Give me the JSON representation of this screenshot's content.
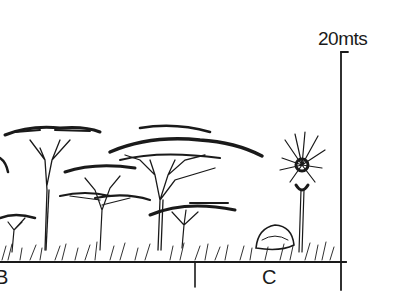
{
  "figure": {
    "type": "vegetation profile sketch",
    "scale_bar": {
      "label": "20mts",
      "height_m": 20
    },
    "zones": [
      {
        "id": "B",
        "label": "B"
      },
      {
        "id": "C",
        "label": "C"
      }
    ],
    "elements": [
      {
        "name": "flat-topped acacia trees",
        "zone": "B"
      },
      {
        "name": "fan palm",
        "zone": "C"
      },
      {
        "name": "rock outcrop / shrub",
        "zone": "C"
      },
      {
        "name": "grass layer",
        "zone": "B,C"
      }
    ],
    "colors": {
      "ink": "#1a1a1a",
      "background": "#ffffff"
    }
  }
}
